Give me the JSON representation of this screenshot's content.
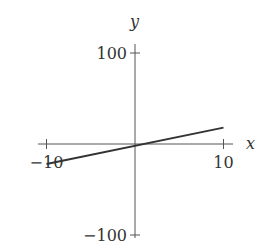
{
  "chart_data": {
    "type": "line",
    "title": "",
    "xlabel": "x",
    "ylabel": "y",
    "xlim": [
      -10,
      10
    ],
    "ylim": [
      -100,
      100
    ],
    "grid": false,
    "x_ticks": [
      -10,
      10
    ],
    "y_ticks": [
      -100,
      100
    ],
    "x_tick_labels": [
      "−10",
      "10"
    ],
    "y_tick_labels": [
      "−100",
      "100"
    ],
    "series": [
      {
        "name": "line",
        "x": [
          -10,
          10
        ],
        "y": [
          -22,
          18
        ]
      }
    ],
    "colors": {
      "line": "#333333",
      "axis": "#555555"
    }
  }
}
